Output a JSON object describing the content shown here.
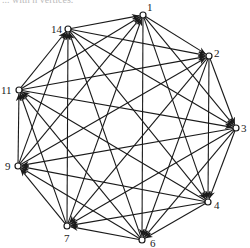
{
  "caption": "... with n vertices.",
  "graph": {
    "type": "tournament",
    "nodes": [
      {
        "id": "1",
        "x": 143,
        "y": 15,
        "lx": 147,
        "ly": 11
      },
      {
        "id": "2",
        "x": 209,
        "y": 56,
        "lx": 214,
        "ly": 57
      },
      {
        "id": "3",
        "x": 236,
        "y": 128,
        "lx": 241,
        "ly": 132
      },
      {
        "id": "4",
        "x": 208,
        "y": 202,
        "lx": 214,
        "ly": 209
      },
      {
        "id": "6",
        "x": 142,
        "y": 240,
        "lx": 150,
        "ly": 247
      },
      {
        "id": "7",
        "x": 67,
        "y": 226,
        "lx": 64,
        "ly": 242
      },
      {
        "id": "9",
        "x": 18,
        "y": 166,
        "lx": 5,
        "ly": 170
      },
      {
        "id": "11",
        "x": 19,
        "y": 90,
        "lx": 1,
        "ly": 94
      },
      {
        "id": "14",
        "x": 68,
        "y": 29,
        "lx": 51,
        "ly": 33
      }
    ],
    "edge_rule": "each vertex points to the next 4 vertices clockwise"
  }
}
